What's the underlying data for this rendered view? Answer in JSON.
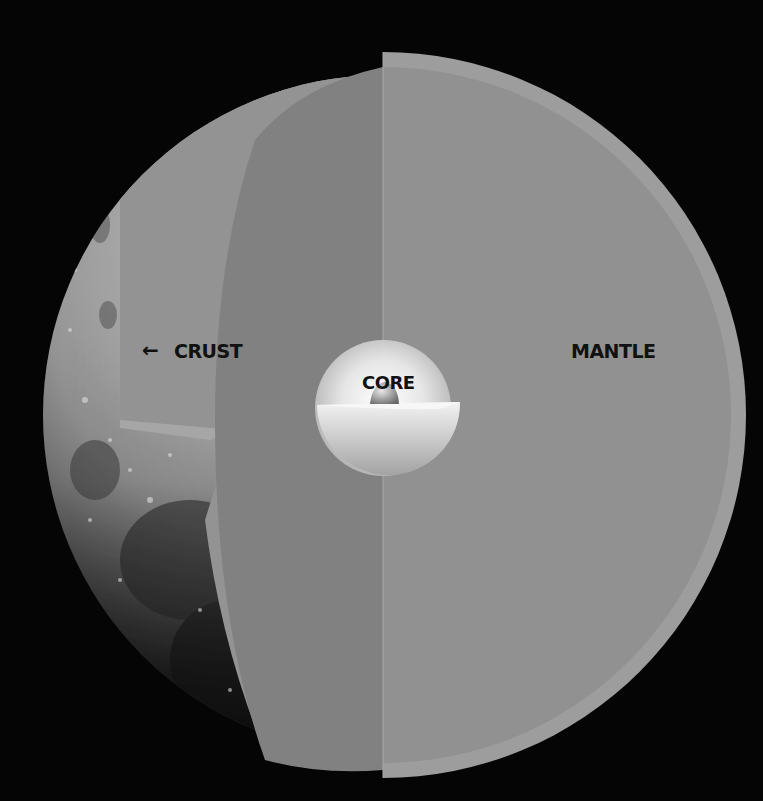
{
  "labels": {
    "crust": "CRUST",
    "crust_arrow": "←",
    "core": "CORE",
    "mantle": "MANTLE"
  },
  "colors": {
    "background": "#050505",
    "crust": "#9a9a9a",
    "mantle_face": "#8e8e8e",
    "mantle_inner_shadow": "#7f7f7f",
    "core_light": "#f2f2f2",
    "core_mid": "#c9c9c9",
    "label_text": "#111111"
  },
  "layers": [
    {
      "name": "Crust",
      "position": "outer shell"
    },
    {
      "name": "Mantle",
      "position": "middle layer"
    },
    {
      "name": "Core",
      "position": "center"
    }
  ]
}
